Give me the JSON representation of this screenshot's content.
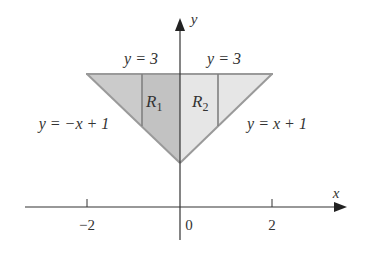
{
  "figure": {
    "x_axis": {
      "label": "x",
      "ticks": [
        {
          "value": -2,
          "label": "−2"
        },
        {
          "value": 0,
          "label": "0"
        },
        {
          "value": 2,
          "label": "2"
        }
      ]
    },
    "y_axis": {
      "label": "y"
    },
    "regions": [
      {
        "name": "R1",
        "base": "R",
        "sub": "1"
      },
      {
        "name": "R2",
        "base": "R",
        "sub": "2"
      }
    ],
    "curve_labels": {
      "top_left": "y = 3",
      "top_right": "y = 3",
      "left_line": "y = −x + 1",
      "right_line": "y = x + 1"
    },
    "colors": {
      "left_fill": "#cbcbcb",
      "r1_fill": "#c2c2c2",
      "right_fill": "#e6e6e6",
      "edge": "#9a9a9a",
      "divider": "#808080",
      "axis": "#333333"
    }
  }
}
